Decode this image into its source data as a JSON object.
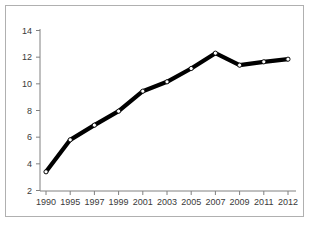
{
  "chart_data": {
    "type": "line",
    "title": "",
    "xlabel": "",
    "ylabel": "",
    "categories": [
      "1990",
      "1995",
      "1997",
      "1999",
      "2001",
      "2003",
      "2005",
      "2007",
      "2009",
      "2011",
      "2012"
    ],
    "x": [
      1990,
      1995,
      1997,
      1999,
      2001,
      2003,
      2005,
      2007,
      2009,
      2011,
      2012
    ],
    "values": [
      3.4,
      5.8,
      6.9,
      7.95,
      9.45,
      10.15,
      11.15,
      12.3,
      11.4,
      11.65,
      11.85
    ],
    "series": [
      {
        "name": "",
        "values": [
          3.4,
          5.8,
          6.9,
          7.95,
          9.45,
          10.15,
          11.15,
          12.3,
          11.4,
          11.65,
          11.85
        ]
      }
    ],
    "ylim": [
      2,
      14
    ],
    "yticks": [
      2,
      4,
      6,
      8,
      10,
      12,
      14
    ],
    "ytick_labels": [
      "2",
      "4",
      "6",
      "8",
      "10",
      "12",
      "14"
    ],
    "xtick_labels": [
      "1990",
      "1995",
      "1997",
      "1999",
      "2001",
      "2003",
      "2005",
      "2007",
      "2009",
      "2011",
      "2012"
    ],
    "grid": false,
    "legend": false,
    "legend_position": "none",
    "line_color": "#000000",
    "marker_face_color": "#ffffff",
    "marker_edge_color": "#000000",
    "axis_color": "#808080",
    "frame_color": "#b0b0b0",
    "background_color": "#ffffff"
  }
}
